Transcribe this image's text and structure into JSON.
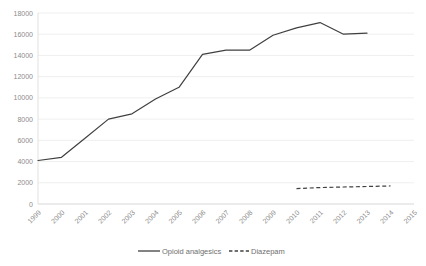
{
  "chart_data": {
    "type": "line",
    "title": "",
    "subtitle": "",
    "xlabel": "",
    "ylabel": "",
    "x": [
      "1999",
      "2000",
      "2001",
      "2002",
      "2003",
      "2004",
      "2005",
      "2006",
      "2007",
      "2008",
      "2009",
      "2010",
      "2011",
      "2012",
      "2013",
      "2014",
      "2015"
    ],
    "categories": [
      "1999",
      "2000",
      "2001",
      "2002",
      "2003",
      "2004",
      "2005",
      "2006",
      "2007",
      "2008",
      "2009",
      "2010",
      "2011",
      "2012",
      "2013",
      "2014",
      "2015"
    ],
    "xlim": [
      "1999",
      "2015"
    ],
    "ylim": [
      0,
      18000
    ],
    "y_ticks": [
      0,
      2000,
      4000,
      6000,
      8000,
      10000,
      12000,
      14000,
      16000,
      18000
    ],
    "y_tick_labels": [
      "0",
      "2000",
      "4000",
      "6000",
      "8000",
      "10000",
      "12000",
      "14000",
      "16000",
      "18000"
    ],
    "x_tick_labels": [
      "1999",
      "2000",
      "2001",
      "2002",
      "2003",
      "2004",
      "2005",
      "2006",
      "2007",
      "2008",
      "2009",
      "2010",
      "2011",
      "2012",
      "2013",
      "2014",
      "2015"
    ],
    "grid": true,
    "grid_axis": "y",
    "legend_position": "bottom",
    "series": [
      {
        "name": "Opioid analgesics",
        "style": "solid",
        "color": "#404040",
        "x": [
          "1999",
          "2000",
          "2001",
          "2002",
          "2003",
          "2004",
          "2005",
          "2006",
          "2007",
          "2008",
          "2009",
          "2010",
          "2011",
          "2012",
          "2013"
        ],
        "values": [
          4100,
          4400,
          6200,
          8000,
          8500,
          9900,
          11000,
          14100,
          14500,
          14500,
          15900,
          16600,
          17100,
          16000,
          16100
        ]
      },
      {
        "name": "Diazepam",
        "style": "dashed",
        "color": "#404040",
        "x": [
          "2010",
          "2011",
          "2012",
          "2013",
          "2014"
        ],
        "values": [
          1450,
          1550,
          1600,
          1650,
          1700
        ]
      }
    ]
  },
  "legend": {
    "items": [
      {
        "label": "Opioid analgesics",
        "style": "solid"
      },
      {
        "label": "Diazepam",
        "style": "dashed"
      }
    ]
  }
}
